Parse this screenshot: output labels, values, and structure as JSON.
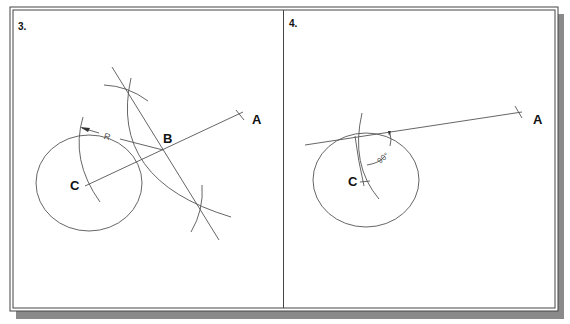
{
  "figure": {
    "panels": [
      {
        "number_label": "3.",
        "labels": {
          "point_a": "A",
          "point_b": "B",
          "point_c": "C",
          "radius": "R"
        }
      },
      {
        "number_label": "4.",
        "labels": {
          "point_a": "A",
          "point_c": "C",
          "angle": "90°"
        }
      }
    ]
  },
  "colors": {
    "line": "#555555",
    "frame": "#444444",
    "shadow": "#8a8a8a",
    "text": "#111111",
    "background": "#ffffff"
  }
}
